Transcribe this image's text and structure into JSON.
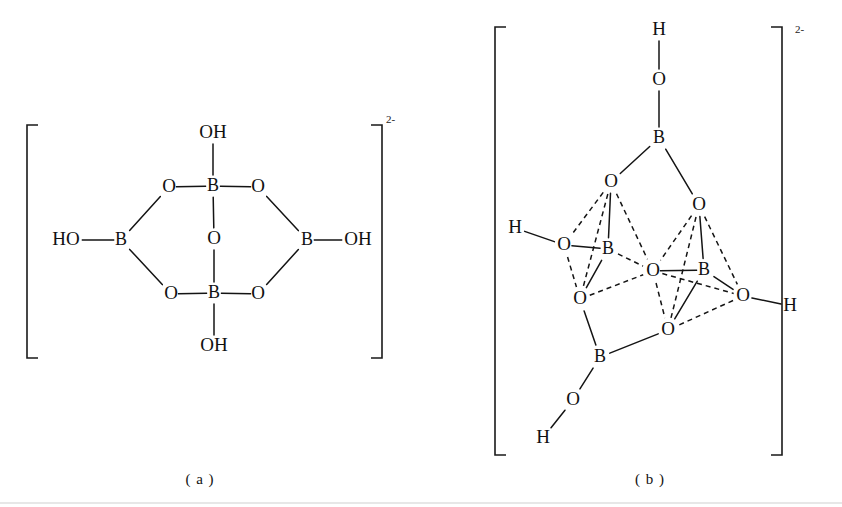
{
  "figure": {
    "background_color": "#ffffff",
    "ink_color": "#141414",
    "captions": [
      {
        "id": "caption-a",
        "text": "( a )",
        "x": 200,
        "y": 481
      },
      {
        "id": "caption-b",
        "text": "( b )",
        "x": 650,
        "y": 481
      }
    ],
    "charge_labels": [
      {
        "id": "charge-a",
        "text": "2-",
        "x": 386,
        "y": 120
      },
      {
        "id": "charge-b",
        "text": "2-",
        "x": 795,
        "y": 30
      }
    ]
  },
  "structure_a": {
    "name": "tetrahydroxy tetraborate ring anion",
    "charge": "2-",
    "caption": "( a )",
    "brackets": {
      "left": {
        "x": 27,
        "y_top": 125,
        "y_bottom": 358,
        "tick": 11
      },
      "right": {
        "x": 382,
        "y_top": 125,
        "y_bottom": 358,
        "tick": 11
      }
    },
    "atoms": [
      {
        "id": "a-oh-top",
        "label": "OH",
        "x": 213,
        "y": 133,
        "element": "OH"
      },
      {
        "id": "a-b-top",
        "label": "B",
        "x": 213,
        "y": 186,
        "element": "B"
      },
      {
        "id": "a-o-topleft",
        "label": "O",
        "x": 169,
        "y": 187,
        "element": "O"
      },
      {
        "id": "a-o-topright",
        "label": "O",
        "x": 258,
        "y": 187,
        "element": "O"
      },
      {
        "id": "a-o-center",
        "label": "O",
        "x": 214,
        "y": 239,
        "element": "O"
      },
      {
        "id": "a-ho-left",
        "label": "HO",
        "x": 66,
        "y": 240,
        "element": "HO"
      },
      {
        "id": "a-b-left",
        "label": "B",
        "x": 121,
        "y": 240,
        "element": "B"
      },
      {
        "id": "a-b-right",
        "label": "B",
        "x": 307,
        "y": 240,
        "element": "B"
      },
      {
        "id": "a-oh-right",
        "label": "OH",
        "x": 358,
        "y": 240,
        "element": "OH"
      },
      {
        "id": "a-o-bottomleft",
        "label": "O",
        "x": 171,
        "y": 294,
        "element": "O"
      },
      {
        "id": "a-b-bottom",
        "label": "B",
        "x": 214,
        "y": 293,
        "element": "B"
      },
      {
        "id": "a-o-bottomright",
        "label": "O",
        "x": 258,
        "y": 294,
        "element": "O"
      },
      {
        "id": "a-oh-bottom",
        "label": "OH",
        "x": 214,
        "y": 346,
        "element": "OH"
      }
    ],
    "bonds": [
      {
        "from": "a-oh-top",
        "to": "a-b-top",
        "style": "solid"
      },
      {
        "from": "a-o-topleft",
        "to": "a-b-top",
        "style": "solid"
      },
      {
        "from": "a-b-top",
        "to": "a-o-topright",
        "style": "solid"
      },
      {
        "from": "a-b-top",
        "to": "a-o-center",
        "style": "solid"
      },
      {
        "from": "a-o-center",
        "to": "a-b-bottom",
        "style": "solid"
      },
      {
        "from": "a-o-topleft",
        "to": "a-b-left",
        "style": "solid"
      },
      {
        "from": "a-ho-left",
        "to": "a-b-left",
        "style": "solid"
      },
      {
        "from": "a-b-left",
        "to": "a-o-bottomleft",
        "style": "solid"
      },
      {
        "from": "a-o-topright",
        "to": "a-b-right",
        "style": "solid"
      },
      {
        "from": "a-b-right",
        "to": "a-oh-right",
        "style": "solid"
      },
      {
        "from": "a-b-right",
        "to": "a-o-bottomright",
        "style": "solid"
      },
      {
        "from": "a-o-bottomleft",
        "to": "a-b-bottom",
        "style": "solid"
      },
      {
        "from": "a-b-bottom",
        "to": "a-o-bottomright",
        "style": "solid"
      },
      {
        "from": "a-b-bottom",
        "to": "a-oh-bottom",
        "style": "solid"
      }
    ]
  },
  "structure_b": {
    "name": "tetraborate cage anion three-dimensional representation",
    "charge": "2-",
    "caption": "( b )",
    "brackets": {
      "left": {
        "x": 495,
        "y_top": 27,
        "y_bottom": 455,
        "tick": 11
      },
      "right": {
        "x": 782,
        "y_top": 27,
        "y_bottom": 455,
        "tick": 11
      }
    },
    "atoms": [
      {
        "id": "b-h-top",
        "label": "H",
        "x": 659,
        "y": 30,
        "element": "H"
      },
      {
        "id": "b-o-top",
        "label": "O",
        "x": 659,
        "y": 80,
        "element": "O"
      },
      {
        "id": "b-b-top",
        "label": "B",
        "x": 659,
        "y": 138,
        "element": "B"
      },
      {
        "id": "b-o-upleft",
        "label": "O",
        "x": 611,
        "y": 182,
        "element": "O"
      },
      {
        "id": "b-o-upright",
        "label": "O",
        "x": 699,
        "y": 205,
        "element": "O"
      },
      {
        "id": "b-h-left",
        "label": "H",
        "x": 515,
        "y": 228,
        "element": "H"
      },
      {
        "id": "b-o-left",
        "label": "O",
        "x": 564,
        "y": 245,
        "element": "O"
      },
      {
        "id": "b-b-left",
        "label": "B",
        "x": 608,
        "y": 249,
        "element": "B"
      },
      {
        "id": "b-o-center",
        "label": "O",
        "x": 653,
        "y": 271,
        "element": "O"
      },
      {
        "id": "b-b-right",
        "label": "B",
        "x": 704,
        "y": 270,
        "element": "B"
      },
      {
        "id": "b-o-lowleft",
        "label": "O",
        "x": 580,
        "y": 299,
        "element": "O"
      },
      {
        "id": "b-o-right",
        "label": "O",
        "x": 743,
        "y": 296,
        "element": "O"
      },
      {
        "id": "b-h-right",
        "label": "H",
        "x": 790,
        "y": 306,
        "element": "H"
      },
      {
        "id": "b-o-lowcenter",
        "label": "O",
        "x": 668,
        "y": 330,
        "element": "O"
      },
      {
        "id": "b-b-bottom",
        "label": "B",
        "x": 600,
        "y": 357,
        "element": "B"
      },
      {
        "id": "b-o-bottom",
        "label": "O",
        "x": 573,
        "y": 400,
        "element": "O"
      },
      {
        "id": "b-h-bottom",
        "label": "H",
        "x": 543,
        "y": 438,
        "element": "H"
      }
    ],
    "bonds": [
      {
        "from": "b-h-top",
        "to": "b-o-top",
        "style": "solid"
      },
      {
        "from": "b-o-top",
        "to": "b-b-top",
        "style": "solid"
      },
      {
        "from": "b-b-top",
        "to": "b-o-upleft",
        "style": "solid"
      },
      {
        "from": "b-b-top",
        "to": "b-o-upright",
        "style": "solid"
      },
      {
        "from": "b-h-left",
        "to": "b-o-left",
        "style": "solid"
      },
      {
        "from": "b-o-left",
        "to": "b-b-left",
        "style": "solid"
      },
      {
        "from": "b-o-upleft",
        "to": "b-b-left",
        "style": "solid"
      },
      {
        "from": "b-o-upleft",
        "to": "b-o-left",
        "style": "dashed"
      },
      {
        "from": "b-o-upleft",
        "to": "b-o-lowleft",
        "style": "dashed"
      },
      {
        "from": "b-o-upleft",
        "to": "b-o-center",
        "style": "dashed"
      },
      {
        "from": "b-o-left",
        "to": "b-o-lowleft",
        "style": "dashed"
      },
      {
        "from": "b-b-left",
        "to": "b-o-lowleft",
        "style": "solid"
      },
      {
        "from": "b-b-left",
        "to": "b-o-center",
        "style": "dashed"
      },
      {
        "from": "b-o-lowleft",
        "to": "b-o-center",
        "style": "dashed"
      },
      {
        "from": "b-o-lowleft",
        "to": "b-b-bottom",
        "style": "solid"
      },
      {
        "from": "b-o-upright",
        "to": "b-b-right",
        "style": "solid"
      },
      {
        "from": "b-o-upright",
        "to": "b-o-center",
        "style": "dashed"
      },
      {
        "from": "b-o-upright",
        "to": "b-o-right",
        "style": "dashed"
      },
      {
        "from": "b-o-upright",
        "to": "b-o-lowcenter",
        "style": "dashed"
      },
      {
        "from": "b-o-center",
        "to": "b-b-right",
        "style": "solid"
      },
      {
        "from": "b-o-center",
        "to": "b-o-lowcenter",
        "style": "dashed"
      },
      {
        "from": "b-o-center",
        "to": "b-o-right",
        "style": "dashed"
      },
      {
        "from": "b-b-right",
        "to": "b-o-right",
        "style": "solid"
      },
      {
        "from": "b-b-right",
        "to": "b-o-lowcenter",
        "style": "solid"
      },
      {
        "from": "b-o-right",
        "to": "b-h-right",
        "style": "solid"
      },
      {
        "from": "b-o-right",
        "to": "b-o-lowcenter",
        "style": "dashed"
      },
      {
        "from": "b-o-lowcenter",
        "to": "b-b-bottom",
        "style": "solid"
      },
      {
        "from": "b-b-bottom",
        "to": "b-o-bottom",
        "style": "solid"
      },
      {
        "from": "b-o-bottom",
        "to": "b-h-bottom",
        "style": "solid"
      }
    ]
  }
}
